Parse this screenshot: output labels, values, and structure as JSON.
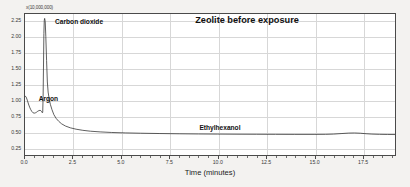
{
  "chart_data": {
    "type": "line",
    "title": "Zeolite before exposure",
    "xlabel": "Time (minutes)",
    "ylabel": "",
    "y_multiplier_label": "x(10,000,000)",
    "xlim": [
      0.0,
      19.2
    ],
    "ylim": [
      0.12,
      2.36
    ],
    "grid": true,
    "legend": "none",
    "x_ticks": [
      "0.0",
      "2.5",
      "5.0",
      "7.5",
      "10.0",
      "12.5",
      "15.0",
      "17.5"
    ],
    "x_tick_values": [
      0.0,
      2.5,
      5.0,
      7.5,
      10.0,
      12.5,
      15.0,
      17.5
    ],
    "y_ticks": [
      "0.25",
      "0.50",
      "0.75",
      "1.00",
      "1.25",
      "1.50",
      "1.75",
      "2.00",
      "2.25"
    ],
    "y_tick_values": [
      0.25,
      0.5,
      0.75,
      1.0,
      1.25,
      1.5,
      1.75,
      2.0,
      2.25
    ],
    "series": [
      {
        "name": "total ion current",
        "x": [
          0.0,
          0.06,
          0.12,
          0.18,
          0.24,
          0.3,
          0.36,
          0.42,
          0.48,
          0.54,
          0.6,
          0.66,
          0.72,
          0.78,
          0.82,
          0.86,
          0.88,
          0.9,
          0.92,
          0.94,
          0.96,
          0.98,
          1.0,
          1.02,
          1.05,
          1.08,
          1.12,
          1.16,
          1.2,
          1.26,
          1.32,
          1.4,
          1.5,
          1.62,
          1.75,
          1.9,
          2.1,
          2.35,
          2.65,
          3.0,
          3.4,
          3.9,
          4.5,
          5.2,
          6.0,
          7.0,
          8.0,
          9.0,
          10.0,
          11.0,
          12.0,
          13.0,
          14.0,
          15.0,
          15.6,
          16.0,
          16.4,
          16.8,
          17.1,
          17.4,
          17.7,
          18.0,
          18.4,
          18.8,
          19.2
        ],
        "y": [
          1.06,
          1.04,
          0.99,
          0.93,
          0.88,
          0.84,
          0.81,
          0.79,
          0.785,
          0.79,
          0.8,
          0.815,
          0.825,
          0.83,
          0.825,
          0.81,
          0.8,
          0.79,
          0.8,
          1.05,
          1.55,
          2.05,
          2.26,
          2.29,
          2.24,
          2.0,
          1.62,
          1.28,
          1.12,
          1.0,
          0.92,
          0.84,
          0.76,
          0.7,
          0.655,
          0.615,
          0.58,
          0.552,
          0.53,
          0.512,
          0.498,
          0.487,
          0.478,
          0.471,
          0.466,
          0.461,
          0.457,
          0.454,
          0.452,
          0.45,
          0.449,
          0.448,
          0.447,
          0.447,
          0.448,
          0.452,
          0.46,
          0.468,
          0.47,
          0.466,
          0.458,
          0.452,
          0.448,
          0.446,
          0.445
        ]
      }
    ],
    "annotations": [
      {
        "name": "argon",
        "text": "Argon",
        "x": 0.6,
        "y": 1.02
      },
      {
        "name": "carbon-dioxide",
        "text": "Carbon dioxide",
        "x": 1.45,
        "y": 2.22
      },
      {
        "name": "ethylhexanol",
        "text": "Ethylhexanol",
        "x": 8.9,
        "y": 0.56
      }
    ]
  }
}
